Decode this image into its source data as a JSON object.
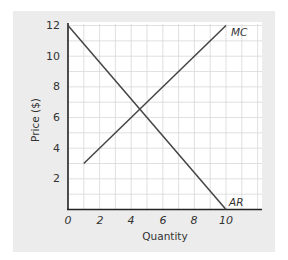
{
  "chart_data": {
    "type": "line",
    "title": "",
    "xlabel": "Quantity",
    "ylabel": "Price ($)",
    "xlim": [
      0,
      12
    ],
    "ylim": [
      0,
      12
    ],
    "grid": true,
    "x_ticks": [
      "0",
      "2",
      "4",
      "6",
      "8",
      "10"
    ],
    "y_ticks": [
      "2",
      "4",
      "6",
      "8",
      "10",
      "12"
    ],
    "series": [
      {
        "name": "MC",
        "x": [
          1,
          10
        ],
        "y": [
          3,
          12
        ]
      },
      {
        "name": "AR",
        "x": [
          0,
          10
        ],
        "y": [
          12,
          0
        ]
      }
    ],
    "annotations": [
      {
        "text": "MC",
        "x": 10,
        "y": 12
      },
      {
        "text": "AR",
        "x": 10,
        "y": 0
      }
    ],
    "legend": "none"
  },
  "labels": {
    "xlabel": "Quantity",
    "ylabel": "Price ($)",
    "mc": "MC",
    "ar": "AR",
    "x0": "0",
    "x2": "2",
    "x4": "4",
    "x6": "6",
    "x8": "8",
    "x10": "10",
    "y2": "2",
    "y4": "4",
    "y6": "6",
    "y8": "8",
    "y10": "10",
    "y12": "12"
  },
  "colors": {
    "panel": "#ececec",
    "plot_bg": "#ffffff",
    "grid": "#d8d8d8",
    "line": "#444444"
  }
}
